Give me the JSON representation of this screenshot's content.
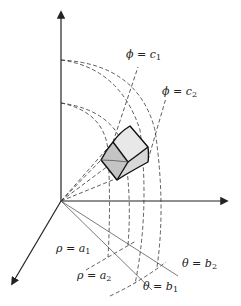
{
  "figure": {
    "colors": {
      "ink": "#222222",
      "shade_light": "#e6e6e6",
      "shade_mid": "#cfcfcf",
      "shade_dark": "#b5b5b5",
      "background": "#ffffff"
    },
    "labels": {
      "phi_c1": {
        "var": "ϕ = c",
        "sub": "1"
      },
      "phi_c2": {
        "var": "ϕ = c",
        "sub": "2"
      },
      "rho_a1": {
        "var": "ρ = a",
        "sub": "1"
      },
      "rho_a2": {
        "var": "ρ = a",
        "sub": "2"
      },
      "theta_b1": {
        "var": "θ = b",
        "sub": "1"
      },
      "theta_b2": {
        "var": "θ = b",
        "sub": "2"
      }
    },
    "axes": [
      "z-axis (up)",
      "y-axis (right)",
      "x-axis (down-left)"
    ]
  }
}
